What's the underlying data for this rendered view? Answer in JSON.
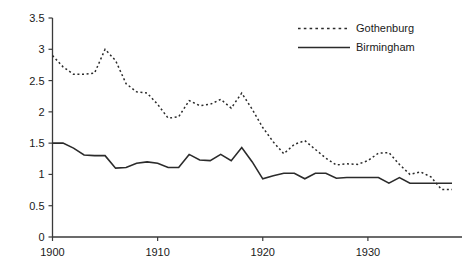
{
  "chart_data": {
    "type": "line",
    "title": "",
    "subtitle": "",
    "xlabel": "",
    "ylabel": "",
    "xlim": [
      1900,
      1938
    ],
    "ylim": [
      0,
      3.5
    ],
    "xticks": [
      1900,
      1910,
      1920,
      1930
    ],
    "xtick_labels": [
      "1900",
      "1910",
      "1920",
      "1930"
    ],
    "yticks": [
      0,
      0.5,
      1,
      1.5,
      2,
      2.5,
      3,
      3.5
    ],
    "ytick_labels": [
      "0",
      "0.5",
      "1",
      "1.5",
      "2",
      "2.5",
      "3",
      "3.5"
    ],
    "grid": false,
    "legend_position": "top-right",
    "x": [
      1900,
      1901,
      1902,
      1903,
      1904,
      1905,
      1906,
      1907,
      1908,
      1909,
      1910,
      1911,
      1912,
      1913,
      1914,
      1915,
      1916,
      1917,
      1918,
      1919,
      1920,
      1921,
      1922,
      1923,
      1924,
      1925,
      1926,
      1927,
      1928,
      1929,
      1930,
      1931,
      1932,
      1933,
      1934,
      1935,
      1936,
      1937,
      1938
    ],
    "series": [
      {
        "name": "Gothenburg",
        "style": "dotted",
        "color": "#2b2b2b",
        "values": [
          2.9,
          2.72,
          2.6,
          2.6,
          2.62,
          3.0,
          2.82,
          2.45,
          2.32,
          2.3,
          2.12,
          1.9,
          1.92,
          2.18,
          2.1,
          2.12,
          2.2,
          2.06,
          2.3,
          2.04,
          1.75,
          1.52,
          1.33,
          1.48,
          1.54,
          1.4,
          1.26,
          1.15,
          1.17,
          1.16,
          1.22,
          1.34,
          1.35,
          1.16,
          1.0,
          1.04,
          0.96,
          0.76,
          0.76
        ]
      },
      {
        "name": "Birmingham",
        "style": "solid",
        "color": "#2b2b2b",
        "values": [
          1.5,
          1.5,
          1.42,
          1.31,
          1.3,
          1.3,
          1.1,
          1.11,
          1.18,
          1.2,
          1.18,
          1.11,
          1.11,
          1.32,
          1.23,
          1.22,
          1.32,
          1.22,
          1.43,
          1.2,
          0.93,
          0.98,
          1.02,
          1.02,
          0.93,
          1.02,
          1.02,
          0.94,
          0.95,
          0.95,
          0.95,
          0.95,
          0.86,
          0.95,
          0.86,
          0.86,
          0.86,
          0.86,
          0.86
        ]
      }
    ]
  },
  "legend": {
    "items": [
      {
        "label": "Gothenburg",
        "style": "dotted"
      },
      {
        "label": "Birmingham",
        "style": "solid"
      }
    ]
  }
}
